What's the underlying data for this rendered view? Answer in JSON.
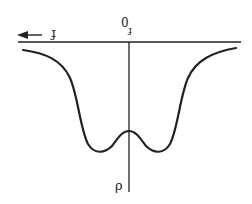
{
  "diagram": {
    "type": "double-well-curve",
    "orientation": "rotated-180",
    "colors": {
      "background": "#ffffff",
      "stroke": "#222222"
    },
    "labels": {
      "horizontal_axis": "f",
      "origin": "0",
      "origin_subscript": "f",
      "vertical_axis": "ρ"
    },
    "arrow": {
      "direction": "left"
    },
    "curve": {
      "description": "symmetric double-well curve with central local maximum on vertical axis",
      "points": [
        [
          23,
          50
        ],
        [
          50,
          57
        ],
        [
          68,
          72
        ],
        [
          78,
          95
        ],
        [
          84,
          125
        ],
        [
          93,
          150
        ],
        [
          110,
          148
        ],
        [
          129,
          131
        ],
        [
          148,
          148
        ],
        [
          165,
          150
        ],
        [
          176,
          125
        ],
        [
          182,
          95
        ],
        [
          194,
          70
        ],
        [
          212,
          55
        ],
        [
          236,
          48
        ]
      ]
    }
  }
}
